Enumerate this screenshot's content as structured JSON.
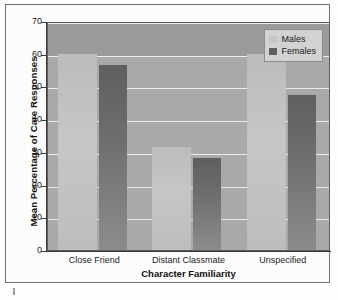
{
  "figure": {
    "background_color": "#fcfcfc",
    "frame_color": "#6f6f6f"
  },
  "legend": {
    "position": "top-right",
    "entries": [
      {
        "label": "Males",
        "color": "#c6c6c6",
        "swatch": "males-swatch"
      },
      {
        "label": "Females",
        "color": "#5f5f5f",
        "swatch": "females-swatch"
      }
    ]
  },
  "axes": {
    "ylabel": "Mean Percentage of Care Responses",
    "xlabel": "Character Familiarity",
    "yticks": [
      "70",
      "60",
      "50",
      "40",
      "30",
      "20",
      "10",
      "0"
    ]
  },
  "chart_data": {
    "type": "bar",
    "title": "",
    "xlabel": "Character Familiarity",
    "ylabel": "Mean Percentage of Care Responses",
    "categories": [
      "Close Friend",
      "Distant Classmate",
      "Unspecified"
    ],
    "series": [
      {
        "name": "Males",
        "color": "#c6c6c6",
        "values": [
          60.0,
          31.5,
          60.0
        ]
      },
      {
        "name": "Females",
        "color": "#5f5f5f",
        "values": [
          56.5,
          28.0,
          47.5
        ]
      }
    ],
    "ylim": [
      0,
      70
    ],
    "ytick_step": 10,
    "yticks": [
      0,
      10,
      20,
      30,
      40,
      50,
      60,
      70
    ],
    "grid": true,
    "grid_axis": "y",
    "grid_color": "#f2f2f2",
    "legend_position": "upper right",
    "plot_background": "#a9a9a9",
    "band_above_60_color": "#9b9b9b"
  }
}
